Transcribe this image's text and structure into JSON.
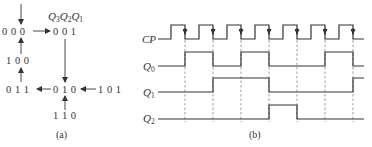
{
  "panel_a": {
    "caption": "(a)",
    "header": {
      "q3": "Q",
      "q3_sub": "3",
      "q2": "Q",
      "q2_sub": "2",
      "q1": "Q",
      "q1_sub": "1"
    },
    "states": {
      "s000": "0 0 0",
      "s001": "0 0 1",
      "s100": "1 0 0",
      "s011": "0 1 1",
      "s010": "0 1 0",
      "s101": "1 0 1",
      "s110": "1 1 0"
    },
    "transitions": [
      {
        "from": "entry",
        "to": "000"
      },
      {
        "from": "000",
        "to": "001"
      },
      {
        "from": "001",
        "to": "010"
      },
      {
        "from": "010",
        "to": "011"
      },
      {
        "from": "011",
        "to": "100"
      },
      {
        "from": "100",
        "to": "000"
      },
      {
        "from": "101",
        "to": "010"
      },
      {
        "from": "110",
        "to": "010"
      }
    ]
  },
  "panel_b": {
    "caption": "(b)",
    "signals": [
      {
        "name": "CP",
        "sub": "",
        "levels": "clock, 7 falling edges"
      },
      {
        "name": "Q",
        "sub": "0",
        "levels": [
          0,
          1,
          0,
          1,
          0,
          0,
          1,
          0
        ]
      },
      {
        "name": "Q",
        "sub": "1",
        "levels": [
          0,
          0,
          1,
          1,
          0,
          0,
          0,
          1
        ]
      },
      {
        "name": "Q",
        "sub": "2",
        "levels": [
          0,
          0,
          0,
          0,
          1,
          0,
          0,
          0
        ]
      }
    ]
  }
}
